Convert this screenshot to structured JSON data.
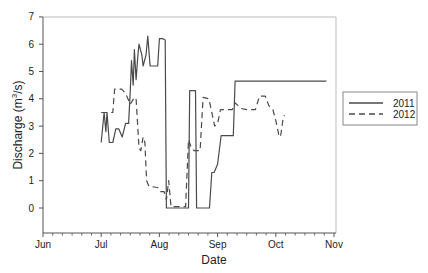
{
  "chart_data": {
    "type": "line",
    "title": "",
    "xlabel": "Date",
    "ylabel": "Discharge (m³/s)",
    "ylabel_parts": {
      "pre": "Discharge (m",
      "sup": "3",
      "post": "/s)"
    },
    "ylim": [
      -0.9,
      7
    ],
    "yticks": [
      0,
      1,
      2,
      3,
      4,
      5,
      6,
      7
    ],
    "xticks": [
      "Jun",
      "Jul",
      "Aug",
      "Sep",
      "Oct",
      "Nov"
    ],
    "x_units": "months since Jun 1",
    "xlim": [
      0,
      5
    ],
    "grid": false,
    "legend_position": "right-outside",
    "series": [
      {
        "name": "2011",
        "style": "solid",
        "points": [
          [
            1.0,
            2.4
          ],
          [
            1.05,
            3.5
          ],
          [
            1.08,
            2.8
          ],
          [
            1.1,
            3.5
          ],
          [
            1.14,
            2.4
          ],
          [
            1.2,
            2.4
          ],
          [
            1.25,
            2.9
          ],
          [
            1.3,
            2.9
          ],
          [
            1.36,
            2.6
          ],
          [
            1.42,
            3.1
          ],
          [
            1.47,
            3.1
          ],
          [
            1.5,
            4.3
          ],
          [
            1.52,
            5.4
          ],
          [
            1.55,
            4.5
          ],
          [
            1.57,
            5.8
          ],
          [
            1.6,
            4.7
          ],
          [
            1.63,
            5.6
          ],
          [
            1.65,
            6.0
          ],
          [
            1.7,
            5.6
          ],
          [
            1.72,
            5.2
          ],
          [
            1.77,
            5.6
          ],
          [
            1.8,
            6.3
          ],
          [
            1.84,
            5.2
          ],
          [
            1.97,
            5.2
          ],
          [
            2.0,
            6.2
          ],
          [
            2.06,
            6.2
          ],
          [
            2.1,
            6.15
          ],
          [
            2.12,
            0.0
          ],
          [
            2.5,
            0.0
          ],
          [
            2.52,
            4.3
          ],
          [
            2.62,
            4.3
          ],
          [
            2.64,
            0.0
          ],
          [
            2.86,
            0.0
          ],
          [
            2.9,
            1.3
          ],
          [
            2.94,
            1.3
          ],
          [
            3.0,
            1.6
          ],
          [
            3.06,
            2.65
          ],
          [
            3.27,
            2.65
          ],
          [
            3.3,
            4.65
          ],
          [
            4.87,
            4.65
          ]
        ]
      },
      {
        "name": "2012",
        "style": "dashed",
        "points": [
          [
            1.0,
            3.5
          ],
          [
            1.2,
            3.5
          ],
          [
            1.23,
            4.35
          ],
          [
            1.35,
            4.35
          ],
          [
            1.42,
            4.2
          ],
          [
            1.5,
            3.8
          ],
          [
            1.57,
            4.05
          ],
          [
            1.6,
            4.0
          ],
          [
            1.65,
            2.2
          ],
          [
            1.68,
            2.1
          ],
          [
            1.72,
            2.6
          ],
          [
            1.75,
            2.4
          ],
          [
            1.78,
            1.0
          ],
          [
            1.82,
            0.8
          ],
          [
            1.97,
            0.75
          ],
          [
            2.02,
            0.6
          ],
          [
            2.08,
            0.6
          ],
          [
            2.12,
            0.3
          ],
          [
            2.16,
            1.0
          ],
          [
            2.2,
            0.05
          ],
          [
            2.45,
            0.05
          ],
          [
            2.5,
            2.5
          ],
          [
            2.55,
            2.2
          ],
          [
            2.6,
            2.1
          ],
          [
            2.7,
            2.1
          ],
          [
            2.75,
            4.05
          ],
          [
            2.85,
            4.0
          ],
          [
            2.95,
            3.0
          ],
          [
            3.0,
            3.1
          ],
          [
            3.05,
            3.6
          ],
          [
            3.25,
            3.6
          ],
          [
            3.3,
            3.85
          ],
          [
            3.4,
            3.65
          ],
          [
            3.5,
            3.6
          ],
          [
            3.65,
            3.6
          ],
          [
            3.72,
            4.1
          ],
          [
            3.82,
            4.1
          ],
          [
            3.88,
            3.75
          ],
          [
            3.95,
            3.6
          ],
          [
            4.0,
            3.2
          ],
          [
            4.05,
            2.7
          ],
          [
            4.08,
            2.6
          ],
          [
            4.12,
            3.2
          ],
          [
            4.15,
            3.4
          ]
        ]
      }
    ]
  },
  "legend": {
    "items": [
      {
        "label": "2011",
        "style": "solid"
      },
      {
        "label": "2012",
        "style": "dashed"
      }
    ]
  },
  "colors": {
    "line": "#4a4a4a",
    "axis": "#555555",
    "frame": "#b8b8b8",
    "text": "#222222"
  }
}
